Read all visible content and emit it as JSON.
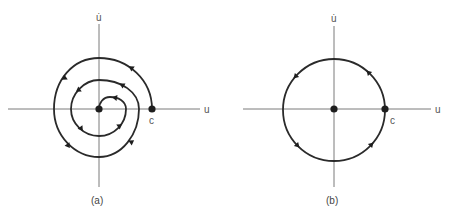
{
  "figure": {
    "panels": [
      {
        "id": "a",
        "caption": "(a)",
        "x_axis_label": "u",
        "y_axis_label": "u̇",
        "point_label": "c",
        "description": "Spiral trajectory from point c winding counterclockwise inward to the origin (stable focus)",
        "origin": [
          99,
          109
        ],
        "start_point": [
          152,
          109
        ],
        "direction": "counterclockwise"
      },
      {
        "id": "b",
        "caption": "(b)",
        "x_axis_label": "u",
        "y_axis_label": "u̇",
        "point_label": "c",
        "description": "Closed circular orbit through point c around the origin (center)",
        "origin": [
          334,
          109
        ],
        "radius": 51,
        "direction": "counterclockwise"
      }
    ],
    "colors": {
      "curve": "#2a2a2a",
      "axis": "#7a7a7a",
      "label": "#555555"
    }
  }
}
